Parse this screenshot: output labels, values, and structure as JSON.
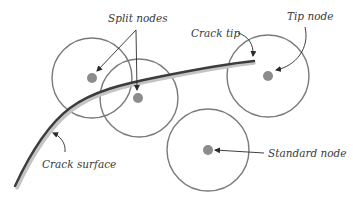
{
  "diagram": {
    "title": "",
    "colors": {
      "circle_stroke": "#7a7a7a",
      "node_fill": "#8c8c8c",
      "crack_stroke": "#3c3c3c",
      "crack_shadow": "#bdbdbd",
      "arrow": "#2a2a2a",
      "text": "#3a3a3a"
    },
    "labels": {
      "split_nodes": "Split nodes",
      "crack_tip": "Crack tip",
      "tip_node": "Tip node",
      "crack_surface": "Crack surface",
      "standard_node": "Standard node"
    },
    "nodes": [
      {
        "id": "split-node-1",
        "type": "split",
        "cx": 92,
        "cy": 78,
        "r": 40
      },
      {
        "id": "split-node-2",
        "type": "split",
        "cx": 139,
        "cy": 98,
        "r": 39
      },
      {
        "id": "tip-node",
        "type": "tip",
        "cx": 268,
        "cy": 76,
        "r": 41
      },
      {
        "id": "standard-node",
        "type": "standard",
        "cx": 208,
        "cy": 150,
        "r": 41
      }
    ]
  }
}
